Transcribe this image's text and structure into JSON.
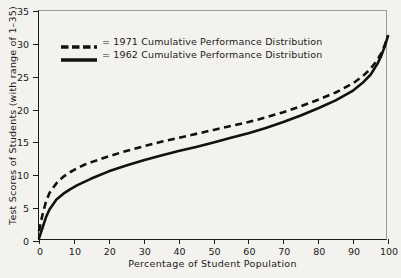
{
  "chart_data": {
    "type": "line",
    "title": "",
    "xlabel": "Percentage of Student Population",
    "ylabel": "Test Scores of Students (with range of 1–35)",
    "xlim": [
      0,
      100
    ],
    "ylim": [
      0,
      35
    ],
    "xticks": [
      0,
      10,
      20,
      30,
      40,
      50,
      60,
      70,
      80,
      90,
      100
    ],
    "yticks": [
      0,
      5,
      10,
      15,
      20,
      25,
      30,
      35
    ],
    "grid": false,
    "legend_position": "upper-left-inside",
    "series": [
      {
        "name": "= 1971 Cumulative Performance Distribution",
        "label": "1971 Cumulative Performance Distribution",
        "style": "dashed",
        "color": "#111111",
        "x": [
          0,
          1,
          2,
          3,
          5,
          7,
          9,
          11,
          13,
          15,
          20,
          25,
          30,
          35,
          40,
          45,
          50,
          55,
          60,
          65,
          70,
          75,
          80,
          85,
          90,
          93,
          95,
          97,
          98,
          99,
          100
        ],
        "y": [
          1.5,
          4.0,
          6.0,
          7.3,
          8.8,
          9.8,
          10.5,
          11.1,
          11.6,
          12.0,
          12.9,
          13.7,
          14.4,
          15.1,
          15.7,
          16.3,
          16.9,
          17.5,
          18.1,
          18.8,
          19.6,
          20.5,
          21.5,
          22.6,
          24.0,
          25.2,
          26.2,
          27.6,
          28.5,
          29.7,
          31.2
        ]
      },
      {
        "name": "= 1962 Cumulative Performance Distribution",
        "label": "1962 Cumulative Performance Distribution",
        "style": "solid",
        "color": "#111111",
        "x": [
          0,
          1,
          2,
          3,
          5,
          7,
          9,
          11,
          13,
          15,
          20,
          25,
          30,
          35,
          40,
          45,
          50,
          55,
          60,
          65,
          70,
          75,
          80,
          85,
          90,
          93,
          95,
          97,
          98,
          99,
          100
        ],
        "y": [
          0.4,
          2.0,
          3.6,
          4.8,
          6.3,
          7.2,
          7.9,
          8.5,
          9.0,
          9.5,
          10.6,
          11.5,
          12.3,
          13.0,
          13.7,
          14.3,
          15.0,
          15.7,
          16.4,
          17.2,
          18.1,
          19.1,
          20.2,
          21.4,
          22.9,
          24.2,
          25.3,
          27.0,
          28.1,
          29.5,
          31.2
        ]
      }
    ]
  },
  "legend": {
    "entries": [
      {
        "swatch": "dashed-line-swatch",
        "text": "= 1971 Cumulative Performance Distribution"
      },
      {
        "swatch": "solid-line-swatch",
        "text": "= 1962 Cumulative Performance Distribution"
      }
    ]
  },
  "axes": {
    "x_title": "Percentage of Student Population",
    "y_title": "Test Scores of Students (with range of 1–35)",
    "x_tick_labels": [
      "0",
      "10",
      "20",
      "30",
      "40",
      "50",
      "60",
      "70",
      "80",
      "90",
      "100"
    ],
    "y_tick_labels": [
      "0",
      "5",
      "10",
      "15",
      "20",
      "25",
      "30",
      "35"
    ]
  },
  "colors": {
    "background": "#f4f2ee",
    "axis": "#1a1a1a",
    "series": "#111111"
  }
}
